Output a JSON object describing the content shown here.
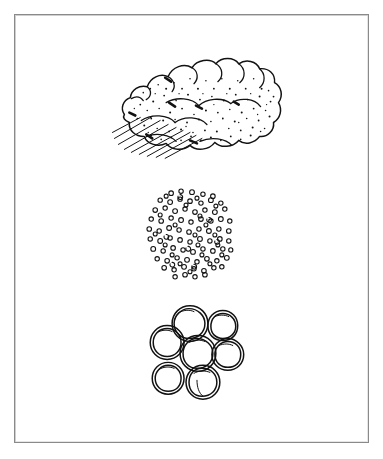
{
  "page": {
    "background_color": "#ffffff",
    "width": 383,
    "height": 459
  },
  "frame": {
    "name": "scan-border",
    "border_color": "#8a8a8a",
    "inner_shadow_color": "#cfcfcf",
    "left": 14,
    "top": 14,
    "width": 355,
    "height": 429
  },
  "style": {
    "ink_color": "#121212",
    "paper_color": "#ffffff",
    "stroke_width": 1.2,
    "technique": "hand-drawn pen and ink line art"
  },
  "figures": [
    {
      "id": "rock-mass",
      "name": "rough-rock-mass",
      "label": "Rough stippled rock mass resting on hatched ground",
      "order": 1,
      "center": [
        197,
        104
      ],
      "bounds": {
        "x": 115,
        "y": 55,
        "width": 165,
        "height": 100
      },
      "features": {
        "outline": "lumpy irregular cloud-like contour",
        "texture": "dense stipple dots",
        "stipple_dot_count": 150,
        "internal_arcs": 7,
        "ground_hatch_lines": 9,
        "hatch_direction": "lower-left to upper-right"
      }
    },
    {
      "id": "fine-grain-disc",
      "name": "fine-grained-aggregate-disc",
      "label": "Circular field of many small open rings (fine grains)",
      "order": 2,
      "center": [
        190,
        232
      ],
      "bounds": {
        "x": 147,
        "y": 188,
        "width": 86,
        "height": 90
      },
      "features": {
        "outline": "circular boundary (implied, not drawn)",
        "ring_count": 132,
        "ring_radius_px": 2.4,
        "arrangement": "randomly jittered grid inside circle"
      }
    },
    {
      "id": "coarse-pebbles",
      "name": "coarse-pebble-cluster",
      "label": "Cluster of seven large irregular pebbles",
      "order": 3,
      "center": [
        196,
        355
      ],
      "bounds": {
        "x": 150,
        "y": 310,
        "width": 96,
        "height": 86
      },
      "features": {
        "pebble_count": 7,
        "outline": "double-traced wobbly circles",
        "arrangement": "hexagonal cluster with one center stone"
      },
      "pebbles": [
        {
          "name": "pebble-top-left",
          "cx": 190,
          "cy": 324,
          "r": 18
        },
        {
          "name": "pebble-top-right",
          "cx": 223,
          "cy": 326,
          "r": 15
        },
        {
          "name": "pebble-mid-left",
          "cx": 167,
          "cy": 343,
          "r": 17
        },
        {
          "name": "pebble-center",
          "cx": 198,
          "cy": 354,
          "r": 18
        },
        {
          "name": "pebble-mid-right",
          "cx": 228,
          "cy": 355,
          "r": 16
        },
        {
          "name": "pebble-bottom-left",
          "cx": 168,
          "cy": 379,
          "r": 16
        },
        {
          "name": "pebble-bottom-mid",
          "cx": 203,
          "cy": 383,
          "r": 17
        }
      ]
    }
  ],
  "annotations": {
    "visible_text": "",
    "caption": ""
  }
}
